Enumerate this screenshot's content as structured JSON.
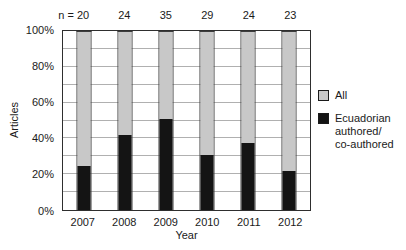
{
  "chart_data": {
    "type": "bar",
    "subtype": "stacked-100-percent",
    "title": "",
    "xlabel": "Year",
    "ylabel": "Articles",
    "categories": [
      "2007",
      "2008",
      "2009",
      "2010",
      "2011",
      "2012"
    ],
    "n_labels": [
      "n = 20",
      "24",
      "35",
      "29",
      "24",
      "23"
    ],
    "series": [
      {
        "name": "Ecuadorian authored/co-authored",
        "color": "#141414",
        "values": [
          25,
          42,
          51.4,
          31,
          37.5,
          21.7
        ]
      },
      {
        "name": "All",
        "color": "#c8c8c8",
        "values": [
          75,
          58,
          48.6,
          69,
          62.5,
          78.3
        ]
      }
    ],
    "ylim": [
      0,
      100
    ],
    "ytick_labels": [
      "0%",
      "20%",
      "40%",
      "60%",
      "80%",
      "100%"
    ],
    "grid": "on",
    "grid_step": 10,
    "grid_color": "#b0b0b0",
    "frame_color": "#2e2e2e",
    "legend_position": "right"
  },
  "legend": {
    "items": [
      {
        "swatch_color": "#c8c8c8",
        "lines": [
          "All"
        ]
      },
      {
        "swatch_color": "#141414",
        "lines": [
          "Ecuadorian",
          "authored/",
          "co-authored"
        ]
      }
    ]
  }
}
